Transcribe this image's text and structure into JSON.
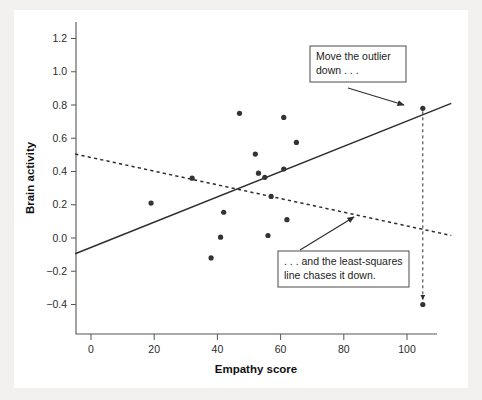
{
  "chart_data": {
    "type": "scatter",
    "title": "",
    "xlabel": "Empathy score",
    "ylabel": "Brain activity",
    "xlim": [
      -5,
      114
    ],
    "ylim": [
      -0.52,
      1.3
    ],
    "xticks": [
      0,
      20,
      40,
      60,
      80,
      100
    ],
    "xtick_labels": [
      "0",
      "20",
      "40",
      "60",
      "80",
      "100"
    ],
    "yticks": [
      -0.4,
      -0.2,
      0.0,
      0.2,
      0.4,
      0.6,
      0.8,
      1.0,
      1.2
    ],
    "ytick_labels": [
      "-0.4",
      "-0.2",
      "0.0",
      "0.2",
      "0.4",
      "0.6",
      "0.8",
      "1.0",
      "1.2"
    ],
    "grid": false,
    "legend": "none",
    "points": [
      {
        "x": 19,
        "y": 0.21
      },
      {
        "x": 32,
        "y": 0.36
      },
      {
        "x": 38,
        "y": -0.12
      },
      {
        "x": 41,
        "y": 0.005
      },
      {
        "x": 42,
        "y": 0.155
      },
      {
        "x": 47,
        "y": 0.75
      },
      {
        "x": 52,
        "y": 0.505
      },
      {
        "x": 53,
        "y": 0.39
      },
      {
        "x": 55,
        "y": 0.365
      },
      {
        "x": 56,
        "y": 0.015
      },
      {
        "x": 57,
        "y": 0.25
      },
      {
        "x": 61,
        "y": 0.725
      },
      {
        "x": 61,
        "y": 0.415
      },
      {
        "x": 62,
        "y": 0.11
      },
      {
        "x": 65,
        "y": 0.575
      },
      {
        "x": 105,
        "y": 0.78
      }
    ],
    "outlier_original": {
      "x": 105,
      "y": 0.78
    },
    "outlier_moved": {
      "x": 105,
      "y": -0.4
    },
    "series": [
      {
        "name": "least-squares line (outlier high)",
        "style": "solid",
        "x": [
          -5,
          114
        ],
        "y": [
          -0.095,
          0.81
        ]
      },
      {
        "name": "least-squares line (outlier moved down)",
        "style": "dashed",
        "x": [
          -5,
          114
        ],
        "y": [
          0.505,
          0.015
        ]
      }
    ],
    "annotations": [
      {
        "id": "move-outlier",
        "text_lines": [
          "Move the outlier",
          "down . . ."
        ],
        "points_to": {
          "x": 105,
          "y": 0.78
        }
      },
      {
        "id": "line-chases",
        "text_lines": [
          ". . . and the least-squares",
          "line chases it down."
        ],
        "points_to": {
          "x": 87,
          "y": 0.125
        }
      }
    ],
    "drop_arrow": {
      "from": {
        "x": 105,
        "y": 0.78
      },
      "to": {
        "x": 105,
        "y": -0.37
      },
      "style": "dashed-arrow"
    }
  },
  "colors": {
    "page_background": "#f2f1ef",
    "plot_background": "#ffffff",
    "ink": "#2e2e2e",
    "axis": "#555555",
    "marker": "#333333"
  }
}
